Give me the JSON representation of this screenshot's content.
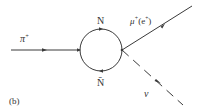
{
  "diagram": {
    "type": "feynman",
    "panel_label": "(b)",
    "colors": {
      "line": "#3a3a3a",
      "text": "#333333",
      "background": "#ffffff"
    },
    "particles": {
      "incoming": {
        "label": "π",
        "superscript": "+",
        "line_style": "solid"
      },
      "loop_top": {
        "label": "N",
        "line_style": "solid"
      },
      "loop_bottom": {
        "label": "N̄",
        "line_style": "solid"
      },
      "outgoing_lepton": {
        "label": "μ",
        "superscript": "+",
        "paren": "(e",
        "paren_sup": "+",
        "paren_close": ")",
        "line_style": "solid"
      },
      "outgoing_neutrino": {
        "label": "ν",
        "line_style": "dashed"
      }
    }
  }
}
